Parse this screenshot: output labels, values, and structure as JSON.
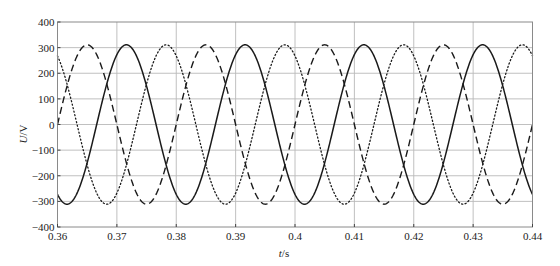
{
  "chart_data": {
    "type": "line",
    "title": "",
    "xlabel": "t/s",
    "xlabel_italic_part": "t",
    "xlabel_unit": "/s",
    "ylabel": "U/V",
    "ylabel_italic_part": "U",
    "ylabel_unit": "/V",
    "xlim": [
      0.36,
      0.44
    ],
    "ylim": [
      -400,
      400
    ],
    "x_ticks": [
      0.36,
      0.37,
      0.38,
      0.39,
      0.4,
      0.41,
      0.42,
      0.43,
      0.44
    ],
    "x_tick_labels": [
      "0.36",
      "0.37",
      "0.38",
      "0.39",
      "0.4",
      "0.41",
      "0.42",
      "0.43",
      "0.44"
    ],
    "y_ticks": [
      400,
      300,
      200,
      100,
      0,
      -100,
      -200,
      -300,
      -400
    ],
    "y_tick_labels": [
      "400",
      "300",
      "200",
      "100",
      "0",
      "-100",
      "-200",
      "-300",
      "-400"
    ],
    "grid": true,
    "legend": null,
    "frequency_hz": 50,
    "series": [
      {
        "name": "phase-a (dashed)",
        "style": "dashed",
        "color": "#1a1a1a",
        "amplitude": 311,
        "peak_time": 0.365,
        "x": [
          0.36,
          0.365,
          0.37,
          0.375,
          0.38,
          0.385,
          0.39,
          0.395,
          0.4,
          0.405,
          0.41,
          0.415,
          0.42,
          0.425,
          0.43,
          0.435,
          0.44
        ],
        "values": [
          0,
          311,
          0,
          -311,
          0,
          311,
          0,
          -311,
          0,
          311,
          0,
          -311,
          0,
          311,
          0,
          -311,
          0
        ]
      },
      {
        "name": "phase-b (solid)",
        "style": "solid",
        "color": "#1a1a1a",
        "amplitude": 311,
        "peak_time": 0.3716,
        "x": [
          0.36,
          0.3616,
          0.3666,
          0.3716,
          0.3766,
          0.3816,
          0.3866,
          0.3916,
          0.3966,
          0.4016,
          0.4066,
          0.4116,
          0.4166,
          0.4216,
          0.4266,
          0.4316,
          0.4366,
          0.44
        ],
        "values": [
          -272,
          -311,
          0,
          311,
          0,
          -311,
          0,
          311,
          0,
          -311,
          0,
          311,
          0,
          -311,
          0,
          311,
          0,
          -272
        ]
      },
      {
        "name": "phase-c (dotted)",
        "style": "dotted",
        "color": "#1a1a1a",
        "amplitude": 311,
        "peak_time": 0.3783,
        "x": [
          0.36,
          0.3633,
          0.3683,
          0.3733,
          0.3783,
          0.3833,
          0.3883,
          0.3933,
          0.3983,
          0.4033,
          0.4083,
          0.4133,
          0.4183,
          0.4233,
          0.4283,
          0.4333,
          0.4383,
          0.44
        ],
        "values": [
          268,
          0,
          -311,
          0,
          311,
          0,
          -311,
          0,
          311,
          0,
          -311,
          0,
          311,
          0,
          -311,
          0,
          311,
          268
        ]
      }
    ]
  },
  "colors": {
    "background": "#ffffff",
    "grid": "#b9b9b9",
    "frame": "#8a8a8a",
    "curve": "#1a1a1a",
    "text": "#222222"
  }
}
